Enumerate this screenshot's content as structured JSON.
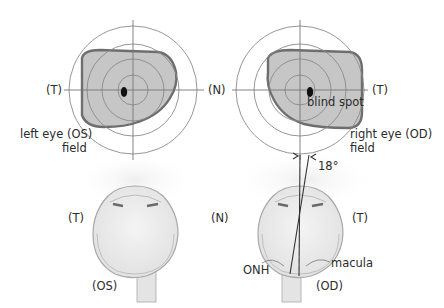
{
  "diagram": {
    "colors": {
      "field_fill": "#c8c8c8",
      "field_stroke": "#6e6e6e",
      "ring_stroke": "#8a8a8a",
      "blind_spot": "#111111",
      "eye_fill": "#ececec",
      "eye_stroke": "#a8a8a8",
      "glow": "#f0f0f0"
    },
    "left_field": {
      "temporal_label": "(T)",
      "nasal_label": "(N)",
      "caption_line1": "left eye (OS)",
      "caption_line2": "field"
    },
    "right_field": {
      "temporal_label": "(T)",
      "blind_spot_label": "blind spot",
      "caption_line1": "right eye (OD)",
      "caption_line2": "field",
      "angle_label": "18°"
    },
    "left_eye": {
      "temporal_label": "(T)",
      "nasal_label": "(N)",
      "eye_label": "(OS)"
    },
    "right_eye": {
      "temporal_label": "(T)",
      "eye_label": "(OD)",
      "onh_label": "ONH",
      "macula_label": "macula"
    }
  }
}
